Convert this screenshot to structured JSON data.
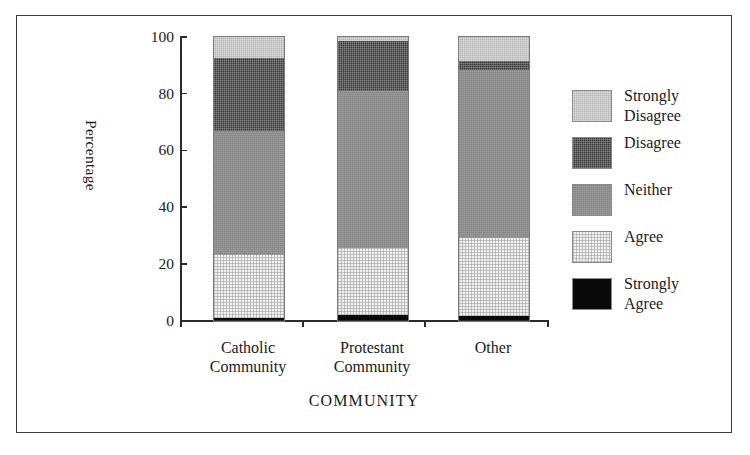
{
  "chart_data": {
    "type": "bar",
    "subtype": "stacked-percentage",
    "title": "",
    "xlabel": "COMMUNITY",
    "ylabel": "Percentage",
    "categories": [
      "Catholic Community",
      "Protestant Community",
      "Other"
    ],
    "category_lines": [
      [
        "Catholic",
        "Community"
      ],
      [
        "Protestant",
        "Community"
      ],
      [
        "Other"
      ]
    ],
    "ylim": [
      0,
      100
    ],
    "yticks": [
      0,
      20,
      40,
      60,
      80,
      100
    ],
    "ytick_labels": [
      "0",
      "20",
      "40",
      "60",
      "80",
      "100"
    ],
    "grid": false,
    "legend_position": "right",
    "stack_order_bottom_to_top": [
      "Strongly Agree",
      "Agree",
      "Neither",
      "Disagree",
      "Strongly Disagree"
    ],
    "series": [
      {
        "name": "Strongly Agree",
        "color": "#0a0a0a",
        "values": [
          1.0,
          2.0,
          1.5
        ]
      },
      {
        "name": "Agree",
        "color": "#efefef",
        "values": [
          22.0,
          23.5,
          27.5
        ]
      },
      {
        "name": "Neither",
        "color": "#8d8d8d",
        "values": [
          44.0,
          55.5,
          59.5
        ]
      },
      {
        "name": "Disagree",
        "color": "#3a3a3a",
        "values": [
          25.5,
          17.5,
          3.0
        ]
      },
      {
        "name": "Strongly Disagree",
        "color": "#b3b3b3",
        "values": [
          7.5,
          1.5,
          8.5
        ]
      }
    ],
    "cumulative_tops": {
      "Catholic Community": {
        "Strongly Agree": 1.0,
        "Agree": 23.0,
        "Neither": 67.0,
        "Disagree": 92.5,
        "Strongly Disagree": 100
      },
      "Protestant Community": {
        "Strongly Agree": 2.0,
        "Agree": 25.5,
        "Neither": 81.0,
        "Disagree": 98.5,
        "Strongly Disagree": 100
      },
      "Other": {
        "Strongly Agree": 1.5,
        "Agree": 29.0,
        "Neither": 88.5,
        "Disagree": 91.5,
        "Strongly Disagree": 100
      }
    }
  },
  "legend": {
    "items": [
      {
        "label_line1": "Strongly",
        "label_line2": "Disagree",
        "key": "strongly-disagree"
      },
      {
        "label_line1": "Disagree",
        "label_line2": "",
        "key": "disagree"
      },
      {
        "label_line1": "Neither",
        "label_line2": "",
        "key": "neither"
      },
      {
        "label_line1": "Agree",
        "label_line2": "",
        "key": "agree"
      },
      {
        "label_line1": "Strongly",
        "label_line2": "Agree",
        "key": "strongly-agree"
      }
    ]
  }
}
